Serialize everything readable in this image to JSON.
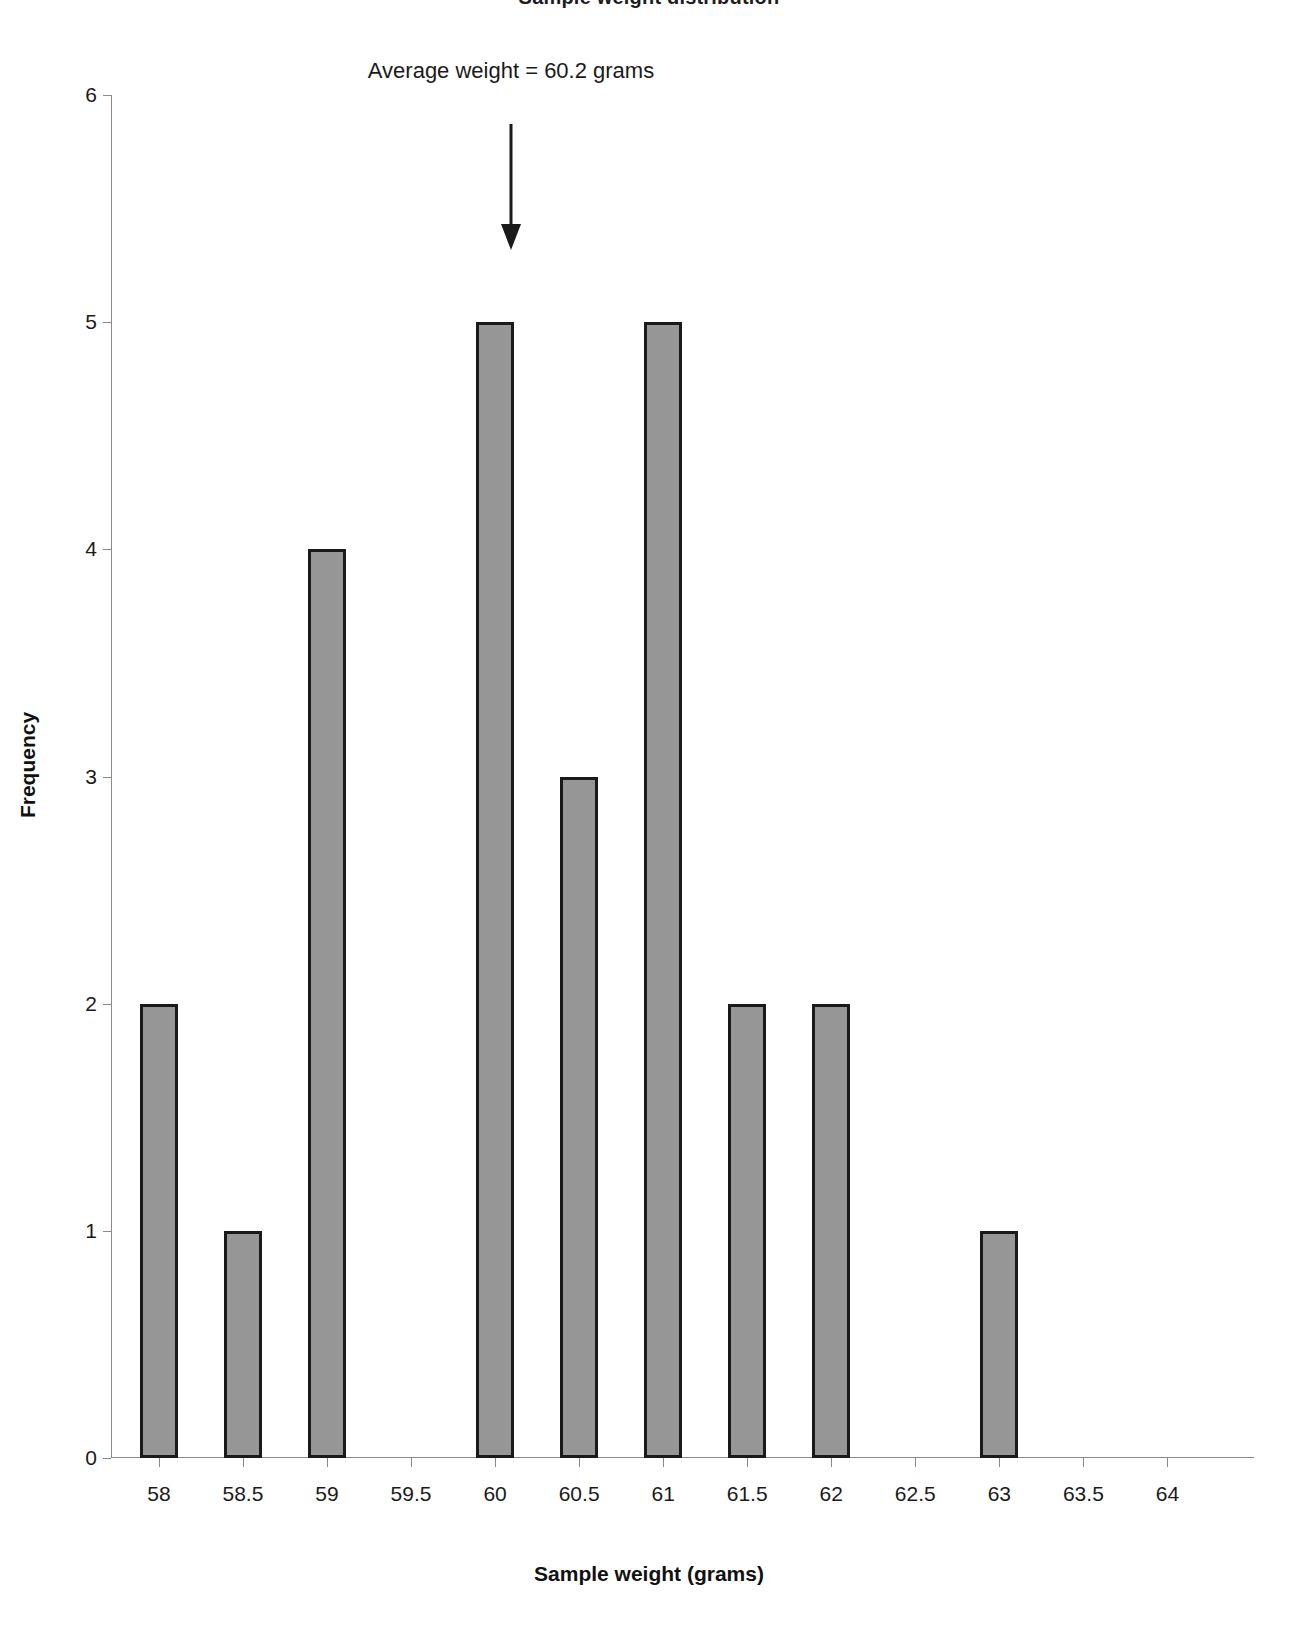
{
  "chart_data": {
    "type": "bar",
    "title": "Sample weight distribution",
    "xlabel": "Sample weight (grams)",
    "ylabel": "Frequency",
    "categories": [
      "58",
      "58.5",
      "59",
      "59.5",
      "60",
      "60.5",
      "61",
      "61.5",
      "62",
      "62.5",
      "63",
      "63.5",
      "64"
    ],
    "values": [
      2,
      1,
      4,
      0,
      5,
      3,
      5,
      2,
      2,
      0,
      1,
      0,
      0
    ],
    "ylim": [
      0,
      6
    ],
    "yticks": [
      "0",
      "1",
      "2",
      "3",
      "4",
      "5",
      "6"
    ],
    "grid": false,
    "legend": false,
    "bar_fill_color": "#969696",
    "bar_edge_color": "#1a1a1a",
    "axis_color": "#8a8a8a",
    "annotations": [
      {
        "text": "Average weight = 60.2 grams",
        "x_value": "60.2",
        "arrow": "down-arrow"
      }
    ]
  },
  "axis": {
    "x_title": "Sample weight (grams)",
    "y_title": "Frequency"
  }
}
